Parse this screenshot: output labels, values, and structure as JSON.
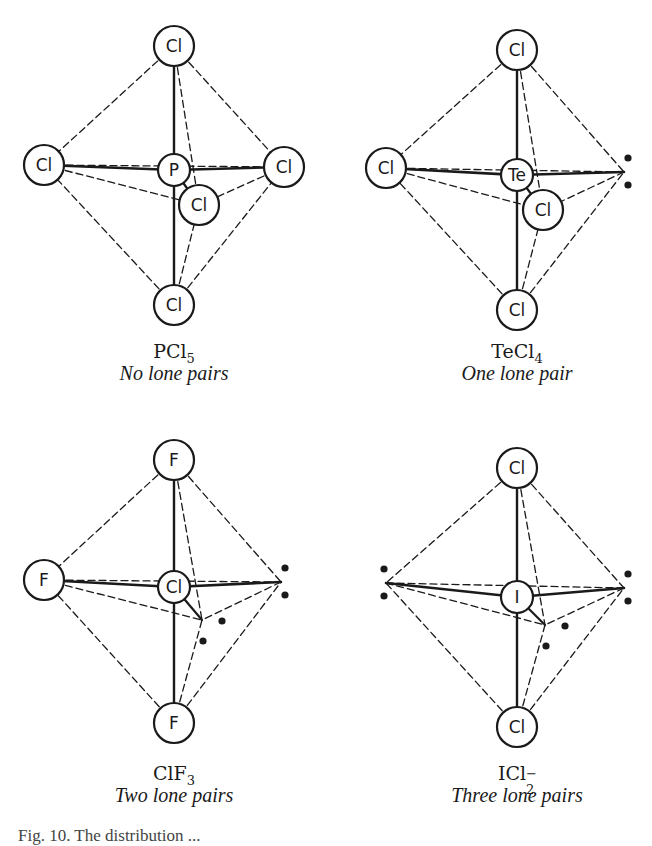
{
  "figure": {
    "panels": [
      {
        "id": "pcl5",
        "formula": "PCl",
        "formula_sub": "5",
        "formula_sup": "",
        "subtitle": "No lone pairs",
        "central_atom": {
          "label": "P",
          "x": 174,
          "y": 170
        },
        "ligands": [
          {
            "label": "Cl",
            "position": "top",
            "x": 174,
            "y": 46
          },
          {
            "label": "Cl",
            "position": "left",
            "x": 44,
            "y": 165
          },
          {
            "label": "Cl",
            "position": "right",
            "x": 284,
            "y": 167
          },
          {
            "label": "Cl",
            "position": "front",
            "x": 199,
            "y": 205
          },
          {
            "label": "Cl",
            "position": "bottom",
            "x": 174,
            "y": 305
          }
        ],
        "lone_pairs": []
      },
      {
        "id": "tecl4",
        "formula": "TeCl",
        "formula_sub": "4",
        "formula_sup": "",
        "subtitle": "One lone pair",
        "central_atom": {
          "label": "Te",
          "x": 517,
          "y": 175
        },
        "ligands": [
          {
            "label": "Cl",
            "position": "top",
            "x": 517,
            "y": 50
          },
          {
            "label": "Cl",
            "position": "left",
            "x": 386,
            "y": 168
          },
          {
            "label": "Cl",
            "position": "front",
            "x": 543,
            "y": 210
          },
          {
            "label": "Cl",
            "position": "bottom",
            "x": 517,
            "y": 310
          }
        ],
        "lone_pairs": [
          {
            "position": "right",
            "x": 624,
            "y": 172
          }
        ]
      },
      {
        "id": "clf3",
        "formula": "ClF",
        "formula_sub": "3",
        "formula_sup": "",
        "subtitle": "Two lone pairs",
        "central_atom": {
          "label": "Cl",
          "x": 174,
          "y": 587
        },
        "ligands": [
          {
            "label": "F",
            "position": "top",
            "x": 174,
            "y": 460
          },
          {
            "label": "F",
            "position": "left",
            "x": 44,
            "y": 580
          },
          {
            "label": "F",
            "position": "bottom",
            "x": 174,
            "y": 723
          }
        ],
        "lone_pairs": [
          {
            "position": "right",
            "x": 281,
            "y": 582
          },
          {
            "position": "front",
            "x": 202,
            "y": 620
          }
        ]
      },
      {
        "id": "icl2",
        "formula": "ICl",
        "formula_sub": "2",
        "formula_sup": "−",
        "subtitle": "Three lone pairs",
        "central_atom": {
          "label": "I",
          "x": 517,
          "y": 597
        },
        "ligands": [
          {
            "label": "Cl",
            "position": "top",
            "x": 517,
            "y": 468
          },
          {
            "label": "Cl",
            "position": "bottom",
            "x": 517,
            "y": 727
          }
        ],
        "lone_pairs": [
          {
            "position": "left",
            "x": 386,
            "y": 583
          },
          {
            "position": "right",
            "x": 624,
            "y": 588
          },
          {
            "position": "front",
            "x": 545,
            "y": 625
          }
        ]
      }
    ],
    "caption_partial": "Fig. 10. The distribution ..."
  },
  "colors": {
    "ink": "#1a1a1a",
    "background": "#ffffff"
  }
}
